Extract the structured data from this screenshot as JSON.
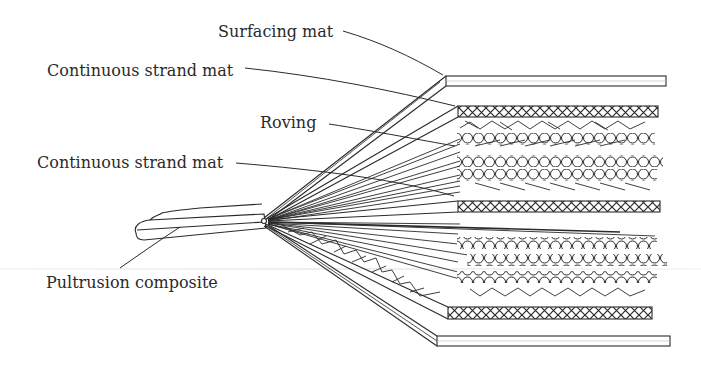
{
  "diagram": {
    "labels": [
      {
        "id": "surfacing-mat",
        "text": "Surfacing mat",
        "x": 218,
        "y": 30
      },
      {
        "id": "continuous-strand-mat-top",
        "text": "Continuous strand mat",
        "x": 47,
        "y": 69
      },
      {
        "id": "roving",
        "text": "Roving",
        "x": 260,
        "y": 115
      },
      {
        "id": "continuous-strand-mat-middle",
        "text": "Continuous strand mat",
        "x": 37,
        "y": 153
      },
      {
        "id": "pultrusion-composite",
        "text": "Pultrusion composite",
        "x": 46,
        "y": 275
      }
    ],
    "layers_top_to_bottom": [
      "Surfacing mat",
      "Continuous strand mat",
      "Roving (3 rows)",
      "Continuous strand mat",
      "Roving (3 rows)",
      "Continuous strand mat",
      "Surfacing mat"
    ],
    "colors": {
      "line": "#2a2a2a",
      "background": "#ffffff",
      "text": "#2a2a2a"
    }
  }
}
